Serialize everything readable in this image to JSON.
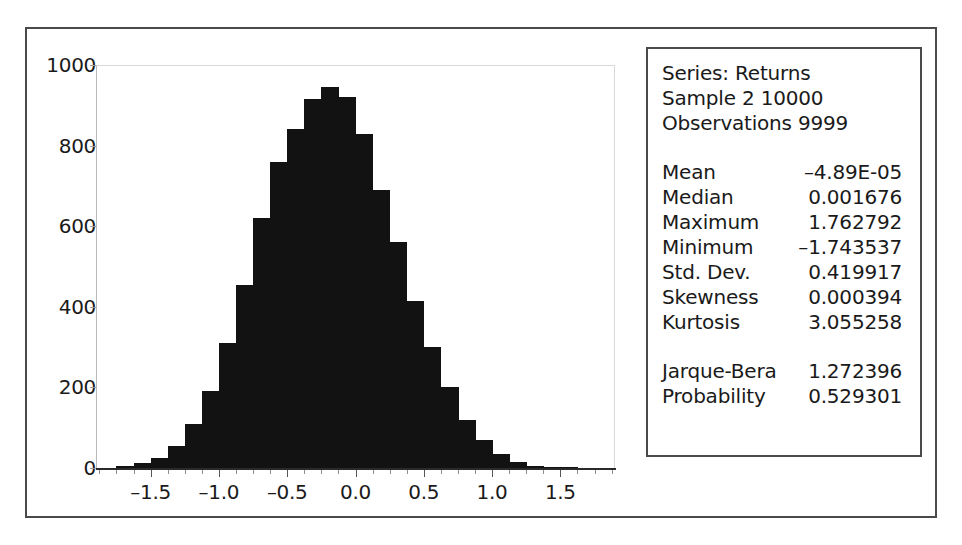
{
  "chart_data": {
    "type": "bar",
    "title": "",
    "subtitle": "",
    "xlabel": "",
    "ylabel": "",
    "grid": false,
    "legend_position": "none",
    "xlim": [
      -1.9,
      1.9
    ],
    "ylim": [
      0,
      1000
    ],
    "x_tick_labels": [
      "-1.5",
      "-1.0",
      "-0.5",
      "0.0",
      "0.5",
      "1.0",
      "1.5"
    ],
    "x_tick_values": [
      -1.5,
      -1.0,
      -0.5,
      0.0,
      0.5,
      1.0,
      1.5
    ],
    "y_tick_labels": [
      "0",
      "200",
      "400",
      "600",
      "800",
      "1000"
    ],
    "y_tick_values": [
      0,
      200,
      400,
      600,
      800,
      1000
    ],
    "bin_width": 0.125,
    "bin_centers": [
      -1.6875,
      -1.5625,
      -1.4375,
      -1.3125,
      -1.1875,
      -1.0625,
      -0.9375,
      -0.8125,
      -0.6875,
      -0.5625,
      -0.4375,
      -0.3125,
      -0.1875,
      -0.0625,
      0.0625,
      0.1875,
      0.3125,
      0.4375,
      0.5625,
      0.6875,
      0.8125,
      0.9375,
      1.0625,
      1.1875,
      1.3125,
      1.4375,
      1.5625
    ],
    "categories": [
      "-1.6875",
      "-1.5625",
      "-1.4375",
      "-1.3125",
      "-1.1875",
      "-1.0625",
      "-0.9375",
      "-0.8125",
      "-0.6875",
      "-0.5625",
      "-0.4375",
      "-0.3125",
      "-0.1875",
      "-0.0625",
      "0.0625",
      "0.1875",
      "0.3125",
      "0.4375",
      "0.5625",
      "0.6875",
      "0.8125",
      "0.9375",
      "1.0625",
      "1.1875",
      "1.3125",
      "1.4375",
      "1.5625"
    ],
    "values": [
      5,
      12,
      25,
      55,
      110,
      190,
      310,
      455,
      620,
      760,
      840,
      915,
      945,
      920,
      830,
      690,
      560,
      415,
      300,
      200,
      120,
      70,
      35,
      14,
      6,
      2,
      1
    ],
    "bar_color": "#121212",
    "series": [
      {
        "name": "Returns",
        "values": [
          5,
          12,
          25,
          55,
          110,
          190,
          310,
          455,
          620,
          760,
          840,
          915,
          945,
          920,
          830,
          690,
          560,
          415,
          300,
          200,
          120,
          70,
          35,
          14,
          6,
          2,
          1
        ]
      }
    ]
  },
  "stats": {
    "header": [
      "Series: Returns",
      "Sample 2 10000",
      "Observations 9999"
    ],
    "rows": [
      {
        "label": "Mean",
        "value": "–4.89E-05"
      },
      {
        "label": "Median",
        "value": "0.001676"
      },
      {
        "label": "Maximum",
        "value": "1.762792"
      },
      {
        "label": "Minimum",
        "value": "–1.743537"
      },
      {
        "label": "Std. Dev.",
        "value": "0.419917"
      },
      {
        "label": "Skewness",
        "value": "0.000394"
      },
      {
        "label": "Kurtosis",
        "value": "3.055258"
      }
    ],
    "tests": [
      {
        "label": "Jarque-Bera",
        "value": "1.272396"
      },
      {
        "label": "Probability",
        "value": "0.529301"
      }
    ]
  },
  "colors": {
    "frame": "#4a4a4a",
    "bar": "#121212",
    "text": "#1a1a1a",
    "background": "#ffffff"
  }
}
